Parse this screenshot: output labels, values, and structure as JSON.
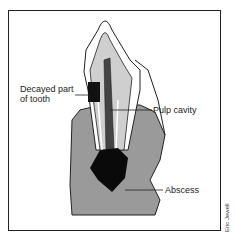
{
  "diagram": {
    "labels": {
      "decayed_line1": "Decayed part",
      "decayed_line2": "of tooth",
      "pulp_cavity": "Pulp cavity",
      "abscess": "Abscess"
    },
    "credit": "Eric Jewell",
    "colors": {
      "bone": "#9a9a9a",
      "gum": "#b8b8b8",
      "dentine": "#cfcfcf",
      "enamel": "#ffffff",
      "decay": "#111111",
      "abscess": "#0a0a0a",
      "outline": "#222222"
    }
  }
}
